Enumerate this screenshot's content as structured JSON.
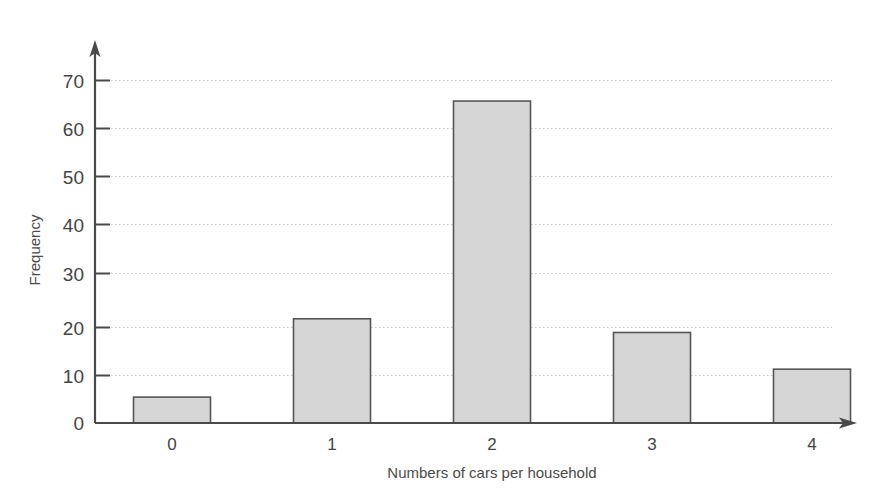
{
  "chart_data": {
    "type": "bar",
    "title": "",
    "subtitle": "",
    "xlabel": "Numbers of cars per household",
    "ylabel": "Frequency",
    "categories": [
      "0",
      "1",
      "2",
      "3",
      "4"
    ],
    "values": [
      5.3,
      21.3,
      65.8,
      18.5,
      11
    ],
    "series": [
      {
        "name": "Frequency",
        "values": [
          5.3,
          21.3,
          65.8,
          18.5,
          11
        ]
      }
    ],
    "ylim": [
      0,
      70
    ],
    "xlim": [
      0,
      5
    ],
    "ytick_labels": [
      "0",
      "10",
      "20",
      "30",
      "40",
      "50",
      "60",
      "70"
    ],
    "ytick_values": [
      0,
      10,
      20,
      30,
      40,
      50,
      60,
      70
    ],
    "xtick_labels": [
      "0",
      "1",
      "2",
      "3",
      "4"
    ],
    "grid": "horizontal-dotted",
    "legend": "none",
    "bar_fill_color": "#d6d6d6",
    "bar_border_color": "#565656",
    "axis_color": "#4a4a4a",
    "grid_color": "#c9c9c9",
    "background_color": "#ffffff",
    "axis_arrows": true,
    "annotations": []
  },
  "axes": {
    "y_axis_name": "y-axis",
    "x_axis_name": "x-axis"
  }
}
